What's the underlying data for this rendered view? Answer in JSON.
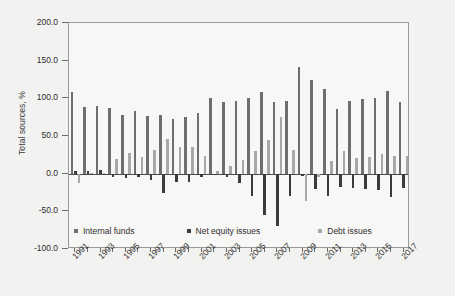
{
  "chart_data": {
    "type": "bar",
    "title": "",
    "xlabel": "",
    "ylabel": "Total sources, %",
    "ylim": [
      -100.0,
      200.0
    ],
    "yticks": [
      "200.0",
      "150.0",
      "100.0",
      "50.0",
      "0.0",
      "-50.0",
      "-100.0"
    ],
    "ytick_values": [
      200.0,
      150.0,
      100.0,
      50.0,
      0.0,
      -50.0,
      -100.0
    ],
    "grid": false,
    "legend_position": "bottom-inside-left",
    "categories": [
      1991,
      1992,
      1993,
      1994,
      1995,
      1996,
      1997,
      1998,
      1999,
      2000,
      2001,
      2002,
      2003,
      2004,
      2005,
      2006,
      2007,
      2008,
      2009,
      2010,
      2011,
      2012,
      2013,
      2014,
      2015,
      2016,
      2017
    ],
    "xtick_labels": [
      "1991",
      "1993",
      "1995",
      "1997",
      "1999",
      "2001",
      "2003",
      "2005",
      "2007",
      "2009",
      "2011",
      "2013",
      "2015",
      "2017"
    ],
    "xtick_years": [
      1991,
      1993,
      1995,
      1997,
      1999,
      2001,
      2003,
      2005,
      2007,
      2009,
      2011,
      2013,
      2015,
      2017
    ],
    "series": [
      {
        "name": "Internal funds",
        "color": "#6e6e6e",
        "values": [
          108.0,
          89.0,
          89.5,
          87.0,
          78.5,
          83.0,
          76.5,
          78.5,
          73.0,
          75.5,
          80.5,
          100.5,
          95.5,
          96.5,
          100.5,
          109.0,
          94.5,
          96.5,
          142.0,
          124.5,
          112.0,
          85.5,
          97.0,
          98.5,
          101.0,
          110.0,
          95.0
        ]
      },
      {
        "name": "Net equity issues",
        "color": "#3b3b3b",
        "values": [
          3.5,
          3.5,
          5.0,
          -5.0,
          -5.5,
          -4.0,
          -9.0,
          -26.0,
          -11.5,
          -11.0,
          -4.5,
          -1.5,
          -4.0,
          -12.5,
          -30.0,
          -54.5,
          -69.0,
          -29.5,
          -3.0,
          -20.5,
          -29.5,
          -18.0,
          -18.5,
          -20.0,
          -21.5,
          -30.5,
          -18.5
        ]
      },
      {
        "name": "Debt issues",
        "color": "#a8a8a8",
        "values": [
          -12.0,
          0.5,
          1.0,
          19.5,
          28.0,
          22.5,
          31.0,
          46.5,
          36.0,
          36.0,
          23.5,
          3.0,
          10.0,
          17.5,
          29.5,
          45.0,
          75.0,
          32.0,
          -36.5,
          -4.0,
          16.5,
          30.5,
          20.5,
          21.5,
          26.5,
          24.0,
          23.5
        ]
      }
    ]
  },
  "legend": {
    "items": [
      {
        "label": "Internal funds",
        "color": "#6e6e6e"
      },
      {
        "label": "Net equity issues",
        "color": "#3b3b3b"
      },
      {
        "label": "Debt issues",
        "color": "#a8a8a8"
      }
    ]
  }
}
